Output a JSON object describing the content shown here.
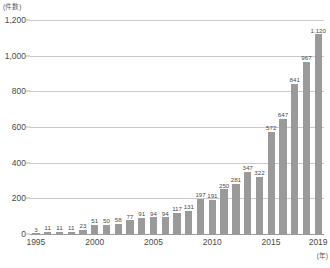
{
  "chart_data": {
    "type": "bar",
    "title": "",
    "subtitle": "",
    "xlabel": "(年)",
    "ylabel": "(件数)",
    "ylim": [
      0,
      1200
    ],
    "ytick_labels": [
      "1,200",
      "1,000",
      "800",
      "600",
      "400",
      "200",
      "0"
    ],
    "ytick_values": [
      1200,
      1000,
      800,
      600,
      400,
      200,
      0
    ],
    "xtick_labels": [
      "1995",
      "2000",
      "2005",
      "2010",
      "2015",
      "2019"
    ],
    "xtick_years": [
      1995,
      2000,
      2005,
      2010,
      2015,
      2019
    ],
    "grid": true,
    "legend": "none",
    "bar_color": "#9a9a9a",
    "gridline_color": "#c9c9c9",
    "axis_color": "#9b9b9b",
    "text_color": "#4a4a4a",
    "categories": [
      "1995",
      "1996",
      "1997",
      "1998",
      "1999",
      "2000",
      "2001",
      "2002",
      "2003",
      "2004",
      "2005",
      "2006",
      "2007",
      "2008",
      "2009",
      "2010",
      "2011",
      "2012",
      "2013",
      "2014",
      "2015",
      "2016",
      "2017",
      "2018",
      "2019"
    ],
    "values": [
      3,
      11,
      11,
      11,
      23,
      51,
      50,
      58,
      77,
      91,
      94,
      94,
      117,
      131,
      197,
      191,
      250,
      281,
      347,
      322,
      572,
      647,
      841,
      967,
      1120
    ],
    "value_labels": [
      "3",
      "11",
      "11",
      "11",
      "23",
      "51",
      "50",
      "58",
      "77",
      "91",
      "94",
      "94",
      "117",
      "131",
      "197",
      "191",
      "250",
      "281",
      "347",
      "322",
      "572",
      "647",
      "841",
      "967",
      "1,120"
    ]
  }
}
